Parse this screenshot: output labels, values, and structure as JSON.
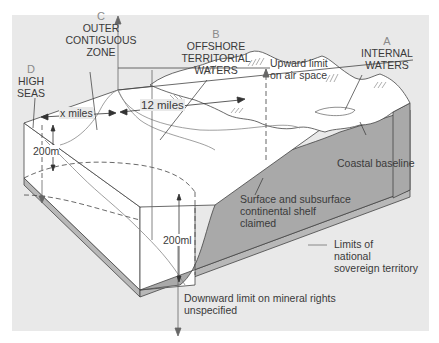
{
  "colors": {
    "panel_bg": "#e9e9e9",
    "block_top": "#ffffff",
    "block_side": "#ffffff",
    "shelf_gray": "#a9a9a9",
    "base_strip": "#b8b8b8",
    "line": "#444444",
    "limit_line": "#888888",
    "letter": "#8a8a8a"
  },
  "zones": [
    {
      "letter": "A",
      "name_lines": [
        "INTERNAL",
        "WATERS"
      ]
    },
    {
      "letter": "B",
      "name_lines": [
        "OFFSHORE",
        "TERRITORIAL",
        "WATERS"
      ]
    },
    {
      "letter": "C",
      "name_lines": [
        "OUTER",
        "CONTIGUOUS",
        "ZONE"
      ]
    },
    {
      "letter": "D",
      "name_lines": [
        "HIGH",
        "SEAS"
      ]
    }
  ],
  "measurements": {
    "x_miles": "x miles",
    "twelve_miles": "12 miles",
    "depth_left": "200m",
    "depth_front": "200ml"
  },
  "annotations": {
    "upward_limit": [
      "Upward limit",
      "on air space"
    ],
    "coastal_baseline": "Coastal baseline",
    "shelf_claim": [
      "Surface and subsurface",
      "continental shelf",
      "claimed"
    ],
    "downward_limit": [
      "Downward limit on mineral rights",
      "unspecified"
    ]
  },
  "legend": {
    "label_lines": [
      "Limits of",
      "national",
      "sovereign territory"
    ]
  }
}
